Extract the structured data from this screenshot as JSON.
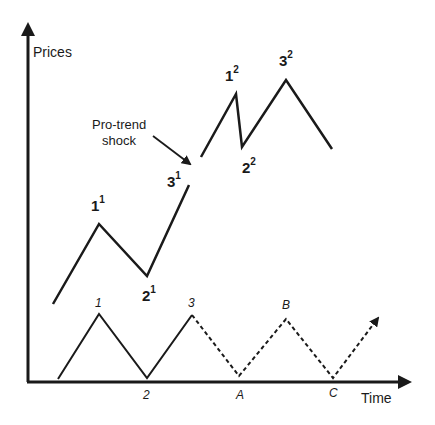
{
  "axes": {
    "y_label": "Prices",
    "x_label": "Time"
  },
  "annotation": {
    "line1": "Pro-trend",
    "line2": "shock"
  },
  "upper_path": {
    "labels": [
      {
        "base": "1",
        "sup": "1"
      },
      {
        "base": "2",
        "sup": "1"
      },
      {
        "base": "3",
        "sup": "1"
      },
      {
        "base": "1",
        "sup": "2"
      },
      {
        "base": "2",
        "sup": "2"
      },
      {
        "base": "3",
        "sup": "2"
      }
    ],
    "segment1_points": [
      [
        53,
        304
      ],
      [
        99,
        224
      ],
      [
        147,
        276
      ],
      [
        189,
        185
      ]
    ],
    "segment2_points": [
      [
        201,
        157
      ],
      [
        236,
        94
      ],
      [
        242,
        147
      ],
      [
        286,
        80
      ],
      [
        332,
        149
      ]
    ]
  },
  "lower_path": {
    "labels": [
      "1",
      "2",
      "3",
      "A",
      "B",
      "C"
    ],
    "solid_points": [
      [
        58,
        379
      ],
      [
        99,
        314
      ],
      [
        147,
        378
      ],
      [
        192,
        315
      ]
    ],
    "dashed_points": [
      [
        192,
        315
      ],
      [
        239,
        376
      ],
      [
        286,
        319
      ],
      [
        333,
        378
      ],
      [
        381,
        314
      ]
    ]
  },
  "colors": {
    "line": "#1a1a1a",
    "background": "#ffffff"
  }
}
